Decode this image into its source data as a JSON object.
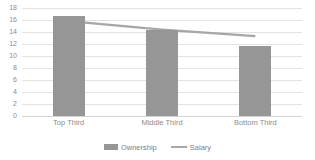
{
  "chart_data": {
    "type": "bar",
    "title": "",
    "subtitle": "",
    "xlabel": "",
    "ylabel": "",
    "categories": [
      "Top Third",
      "Middle Third",
      "Bottom Third"
    ],
    "series": [
      {
        "name": "Ownership",
        "type": "bar",
        "color": "#969696",
        "values": [
          16.6,
          14.3,
          11.7
        ]
      },
      {
        "name": "Salary",
        "type": "line",
        "color": "#a6a6a6",
        "values": [
          15.8,
          14.4,
          13.3
        ]
      }
    ],
    "ylim": [
      0,
      18
    ],
    "yticks": [
      0,
      2,
      4,
      6,
      8,
      10,
      12,
      14,
      16,
      18
    ],
    "ytick_labels": [
      "0",
      "2",
      "4",
      "6",
      "8",
      "10",
      "12",
      "14",
      "16",
      "18"
    ],
    "grid": true,
    "grid_color": "#e3e3e3",
    "legend_position": "bottom",
    "background": "#ffffff"
  },
  "legend": {
    "items": [
      {
        "label": "Ownership",
        "marker": "bar-swatch-icon"
      },
      {
        "label": "Salary",
        "marker": "line-swatch-icon"
      }
    ]
  }
}
